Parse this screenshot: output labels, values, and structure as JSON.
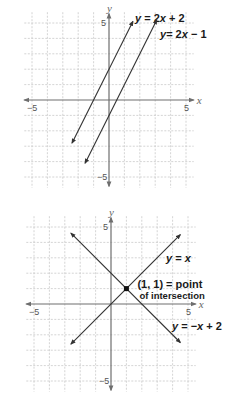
{
  "chart_data": [
    {
      "type": "line",
      "title": "",
      "xlabel": "x",
      "ylabel": "y",
      "xlim": [
        -5.5,
        5.5
      ],
      "ylim": [
        -5.5,
        5.5
      ],
      "grid": true,
      "tick_labels": {
        "x_neg": "−5",
        "x_pos": "5",
        "y_pos": "5",
        "y_neg": "−5"
      },
      "series": [
        {
          "name": "y = 2x + 2",
          "label_parts": [
            "y",
            " = 2",
            "x",
            " + 2"
          ],
          "slope": 2,
          "intercept": 2,
          "x_range": [
            -2.4,
            1.55
          ]
        },
        {
          "name": "y = 2x − 1",
          "label_parts": [
            "y",
            "= 2",
            "x",
            " − 1"
          ],
          "slope": 2,
          "intercept": -1,
          "x_range": [
            -1.55,
            3.1
          ]
        }
      ]
    },
    {
      "type": "line",
      "title": "",
      "xlabel": "x",
      "ylabel": "y",
      "xlim": [
        -5.5,
        5.5
      ],
      "ylim": [
        -5.5,
        5.5
      ],
      "grid": true,
      "tick_labels": {
        "x_neg": "−5",
        "x_pos": "5",
        "y_pos": "5",
        "y_neg": "−5"
      },
      "series": [
        {
          "name": "y = x",
          "label_parts": [
            "y",
            " = ",
            "x",
            ""
          ],
          "slope": 1,
          "intercept": 0,
          "x_range": [
            -2.6,
            4.5
          ]
        },
        {
          "name": "y = −x + 2",
          "label_parts": [
            "y",
            " = −",
            "x",
            " + 2"
          ],
          "slope": -1,
          "intercept": 2,
          "x_range": [
            -2.6,
            4.5
          ]
        }
      ],
      "points": [
        {
          "x": 1,
          "y": 1,
          "label_line1": "(1, 1) = point",
          "label_line2": "of intersection"
        }
      ]
    }
  ]
}
